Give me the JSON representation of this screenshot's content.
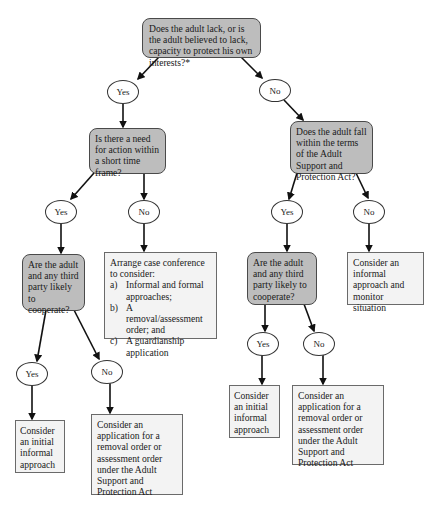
{
  "nodes": {
    "q_capacity": "Does the adult lack, or is the adult believed to lack, capacity to protect his own interests?*",
    "q_short_time": "Is there a need for action within a short time frame?",
    "q_asp_act": "Does the adult fall within the terms of the Adult Support and Protection Act?",
    "q_cooperate_left": "Are the adult and any third party likely to cooperate?",
    "q_cooperate_right": "Are the adult and any third party likely to cooperate?",
    "a_case_conference": {
      "intro": "Arrange case conference to consider:",
      "items": [
        {
          "marker": "a)",
          "text": "Informal and formal approaches;"
        },
        {
          "marker": "b)",
          "text": "A removal/assessment order; and"
        },
        {
          "marker": "c)",
          "text": "A guardianship application"
        }
      ]
    },
    "a_informal_monitor": "Consider an informal approach and monitor situation",
    "a_initial_left": "Consider an initial informal approach",
    "a_application_left": "Consider an application for a removal order or assessment order under the Adult Support and Protection Act",
    "a_initial_right": "Consider an initial informal approach",
    "a_application_right": "Consider an application for a removal order or assessment order under the Adult Support and Protection Act"
  },
  "labels": {
    "yes": "Yes",
    "no": "No"
  }
}
